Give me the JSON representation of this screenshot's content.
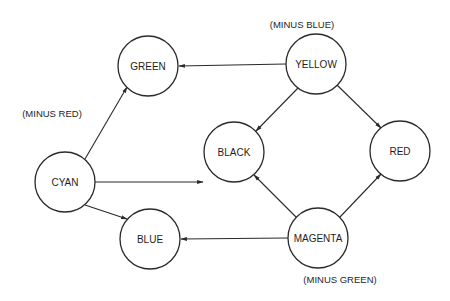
{
  "diagram": {
    "nodes": [
      {
        "id": "green",
        "label": "GREEN",
        "x": 148,
        "y": 66
      },
      {
        "id": "yellow",
        "label": "YELLOW",
        "x": 316,
        "y": 64
      },
      {
        "id": "cyan",
        "label": "CYAN",
        "x": 65,
        "y": 182
      },
      {
        "id": "black",
        "label": "BLACK",
        "x": 234,
        "y": 152
      },
      {
        "id": "red",
        "label": "RED",
        "x": 400,
        "y": 151
      },
      {
        "id": "blue",
        "label": "BLUE",
        "x": 150,
        "y": 239
      },
      {
        "id": "magenta",
        "label": "MAGENTA",
        "x": 318,
        "y": 238
      }
    ],
    "annotations": {
      "cyan": "(MINUS  RED)",
      "yellow": "(MINUS  BLUE)",
      "magenta": "(MINUS   GREEN)"
    },
    "edges": [
      {
        "from": "yellow",
        "to": "green"
      },
      {
        "from": "yellow",
        "to": "black"
      },
      {
        "from": "yellow",
        "to": "red"
      },
      {
        "from": "cyan",
        "to": "green"
      },
      {
        "from": "cyan",
        "to": "black"
      },
      {
        "from": "cyan",
        "to": "blue"
      },
      {
        "from": "magenta",
        "to": "black"
      },
      {
        "from": "magenta",
        "to": "red"
      },
      {
        "from": "magenta",
        "to": "blue"
      }
    ]
  }
}
